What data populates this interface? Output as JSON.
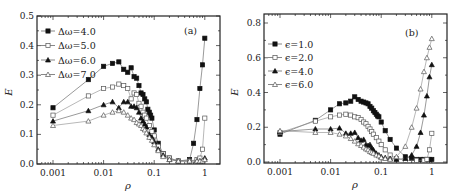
{
  "figure": {
    "panels": [
      {
        "id": "a",
        "tag": "(a)",
        "xlabel": "ρ",
        "ylabel": "E"
      },
      {
        "id": "b",
        "tag": "(b)",
        "xlabel": "ρ",
        "ylabel": "E"
      }
    ]
  },
  "chart_data": [
    {
      "type": "line",
      "title": "(a)",
      "xlabel": "ρ",
      "ylabel": "E",
      "xscale": "log",
      "xlim": [
        0.0005,
        2
      ],
      "ylim": [
        0,
        0.5
      ],
      "xticks": [
        0.001,
        0.01,
        0.1,
        1
      ],
      "xtick_labels": [
        "0.001",
        "0.01",
        "0.1",
        "1"
      ],
      "yticks": [
        0.0,
        0.1,
        0.2,
        0.3,
        0.4,
        0.5
      ],
      "ytick_labels": [
        "0.0",
        "0.1",
        "0.2",
        "0.3",
        "0.4",
        "0.5"
      ],
      "legend_position": "upper left",
      "series": [
        {
          "name": "Δω=4.0",
          "marker": "filled-square",
          "x": [
            0.001,
            0.005,
            0.01,
            0.015,
            0.02,
            0.025,
            0.03,
            0.035,
            0.04,
            0.045,
            0.05,
            0.055,
            0.06,
            0.065,
            0.07,
            0.075,
            0.08,
            0.085,
            0.09,
            0.1,
            0.12,
            0.15,
            0.2,
            0.3,
            0.5,
            0.6,
            0.7,
            0.8,
            0.9,
            1.0
          ],
          "y": [
            0.19,
            0.285,
            0.33,
            0.34,
            0.345,
            0.32,
            0.31,
            0.325,
            0.295,
            0.29,
            0.265,
            0.24,
            0.235,
            0.22,
            0.21,
            0.185,
            0.175,
            0.165,
            0.155,
            0.115,
            0.07,
            0.035,
            0.02,
            0.01,
            0.015,
            0.07,
            0.15,
            0.255,
            0.335,
            0.425
          ]
        },
        {
          "name": "Δω=5.0",
          "marker": "open-square",
          "x": [
            0.001,
            0.005,
            0.01,
            0.015,
            0.02,
            0.025,
            0.03,
            0.035,
            0.04,
            0.045,
            0.05,
            0.055,
            0.06,
            0.065,
            0.07,
            0.08,
            0.09,
            0.1,
            0.12,
            0.15,
            0.2,
            0.3,
            0.5,
            0.7,
            0.8,
            0.9,
            1.0
          ],
          "y": [
            0.165,
            0.23,
            0.255,
            0.26,
            0.27,
            0.265,
            0.255,
            0.22,
            0.24,
            0.235,
            0.205,
            0.195,
            0.175,
            0.165,
            0.155,
            0.13,
            0.11,
            0.095,
            0.06,
            0.035,
            0.02,
            0.01,
            0.01,
            0.015,
            0.02,
            0.05,
            0.155
          ]
        },
        {
          "name": "Δω=6.0",
          "marker": "filled-triangle",
          "x": [
            0.001,
            0.005,
            0.01,
            0.015,
            0.02,
            0.025,
            0.03,
            0.035,
            0.04,
            0.045,
            0.05,
            0.055,
            0.06,
            0.065,
            0.07,
            0.08,
            0.09,
            0.1,
            0.12,
            0.15,
            0.2,
            0.3,
            0.5,
            0.7,
            0.8,
            0.9,
            1.0
          ],
          "y": [
            0.145,
            0.18,
            0.2,
            0.21,
            0.19,
            0.21,
            0.21,
            0.195,
            0.195,
            0.19,
            0.175,
            0.155,
            0.145,
            0.135,
            0.125,
            0.1,
            0.09,
            0.075,
            0.05,
            0.03,
            0.015,
            0.01,
            0.01,
            0.01,
            0.01,
            0.01,
            0.02
          ]
        },
        {
          "name": "Δω=7.0",
          "marker": "open-triangle",
          "x": [
            0.001,
            0.005,
            0.01,
            0.015,
            0.02,
            0.025,
            0.03,
            0.035,
            0.04,
            0.045,
            0.05,
            0.055,
            0.06,
            0.065,
            0.07,
            0.08,
            0.09,
            0.1,
            0.12,
            0.15,
            0.2,
            0.3,
            0.5,
            0.7,
            0.8,
            0.9,
            1.0
          ],
          "y": [
            0.13,
            0.145,
            0.165,
            0.175,
            0.18,
            0.175,
            0.165,
            0.155,
            0.15,
            0.14,
            0.135,
            0.13,
            0.12,
            0.115,
            0.105,
            0.09,
            0.08,
            0.065,
            0.045,
            0.025,
            0.015,
            0.01,
            0.01,
            0.01,
            0.01,
            0.01,
            0.015
          ]
        }
      ]
    },
    {
      "type": "line",
      "title": "(b)",
      "xlabel": "ρ",
      "ylabel": "E",
      "xscale": "log",
      "xlim": [
        0.0005,
        2
      ],
      "ylim": [
        0,
        0.85
      ],
      "xticks": [
        0.001,
        0.01,
        0.1,
        1
      ],
      "xtick_labels": [
        "0.001",
        "0.01",
        "0.1",
        "1"
      ],
      "yticks": [
        0.0,
        0.2,
        0.4,
        0.6,
        0.8
      ],
      "ytick_labels": [
        "0.0",
        "0.2",
        "0.4",
        "0.6",
        "0.8"
      ],
      "legend_position": "upper left",
      "series": [
        {
          "name": "ϵ=1.0",
          "marker": "filled-square",
          "x": [
            0.001,
            0.005,
            0.01,
            0.015,
            0.02,
            0.025,
            0.03,
            0.035,
            0.04,
            0.045,
            0.05,
            0.055,
            0.06,
            0.065,
            0.07,
            0.075,
            0.08,
            0.085,
            0.09,
            0.1,
            0.12,
            0.15,
            0.2,
            0.3,
            0.4,
            0.5,
            0.6,
            0.7,
            0.8,
            0.9,
            1.0
          ],
          "y": [
            0.16,
            0.24,
            0.3,
            0.335,
            0.34,
            0.35,
            0.375,
            0.36,
            0.35,
            0.345,
            0.34,
            0.335,
            0.32,
            0.31,
            0.295,
            0.285,
            0.275,
            0.265,
            0.26,
            0.23,
            0.18,
            0.13,
            0.08,
            0.03,
            0.02,
            0.015,
            0.015,
            0.015,
            0.015,
            0.015,
            0.015
          ]
        },
        {
          "name": "ϵ=2.0",
          "marker": "open-square",
          "x": [
            0.001,
            0.005,
            0.01,
            0.015,
            0.02,
            0.025,
            0.03,
            0.035,
            0.04,
            0.045,
            0.05,
            0.055,
            0.06,
            0.065,
            0.07,
            0.08,
            0.09,
            0.1,
            0.12,
            0.15,
            0.2,
            0.3,
            0.5,
            0.7,
            0.8,
            0.9,
            1.0
          ],
          "y": [
            0.17,
            0.235,
            0.26,
            0.27,
            0.275,
            0.27,
            0.26,
            0.255,
            0.245,
            0.23,
            0.22,
            0.205,
            0.19,
            0.175,
            0.16,
            0.14,
            0.12,
            0.1,
            0.07,
            0.04,
            0.02,
            0.01,
            0.01,
            0.01,
            0.015,
            0.07,
            0.165
          ]
        },
        {
          "name": "ϵ=4.0",
          "marker": "filled-triangle",
          "x": [
            0.001,
            0.005,
            0.01,
            0.015,
            0.02,
            0.025,
            0.03,
            0.035,
            0.04,
            0.045,
            0.05,
            0.055,
            0.06,
            0.065,
            0.07,
            0.08,
            0.09,
            0.1,
            0.12,
            0.15,
            0.2,
            0.3,
            0.4,
            0.5,
            0.6,
            0.7,
            0.8,
            0.9,
            1.0
          ],
          "y": [
            0.175,
            0.19,
            0.19,
            0.195,
            0.165,
            0.165,
            0.17,
            0.14,
            0.125,
            0.13,
            0.1,
            0.095,
            0.1,
            0.08,
            0.07,
            0.05,
            0.04,
            0.03,
            0.025,
            0.02,
            0.015,
            0.02,
            0.04,
            0.09,
            0.17,
            0.27,
            0.38,
            0.49,
            0.56
          ]
        },
        {
          "name": "ϵ=6.0",
          "marker": "open-triangle",
          "x": [
            0.001,
            0.005,
            0.01,
            0.015,
            0.02,
            0.025,
            0.03,
            0.035,
            0.04,
            0.045,
            0.05,
            0.055,
            0.06,
            0.065,
            0.07,
            0.08,
            0.09,
            0.1,
            0.12,
            0.15,
            0.2,
            0.3,
            0.4,
            0.5,
            0.6,
            0.7,
            0.8,
            0.9,
            1.0
          ],
          "y": [
            0.18,
            0.17,
            0.17,
            0.16,
            0.15,
            0.135,
            0.12,
            0.105,
            0.095,
            0.085,
            0.075,
            0.07,
            0.06,
            0.055,
            0.05,
            0.04,
            0.035,
            0.025,
            0.02,
            0.015,
            0.03,
            0.09,
            0.2,
            0.31,
            0.42,
            0.52,
            0.6,
            0.66,
            0.71
          ]
        }
      ]
    }
  ]
}
